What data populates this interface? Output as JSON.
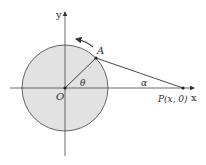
{
  "diagram": {
    "axes": {
      "x_label": "x",
      "y_label": "y"
    },
    "circle": {
      "cx": 65,
      "cy": 88,
      "r": 43,
      "fill": "#e2e2e2",
      "stroke": "#555555"
    },
    "points": {
      "origin": {
        "label": "O",
        "x": 65,
        "y": 88
      },
      "A": {
        "label": "A",
        "x": 96,
        "y": 58
      },
      "P": {
        "label_main": "P",
        "label_coords": "(x, 0)",
        "x": 183,
        "y": 88
      }
    },
    "angles": {
      "theta": "θ",
      "alpha": "α"
    },
    "rotation_arrow": "counterclockwise"
  }
}
